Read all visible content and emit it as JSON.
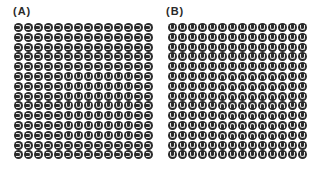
{
  "panels": [
    {
      "label": "(A)",
      "rows": 14,
      "cols": 14,
      "background_glyph": "C",
      "target_glyph": "U",
      "target_region": {
        "row_start": 5,
        "row_end": 11,
        "col_start": 5,
        "col_end": 11
      }
    },
    {
      "label": "(B)",
      "rows": 14,
      "cols": 14,
      "background_glyph": "U",
      "target_glyph": "N",
      "target_region": {
        "row_start": 5,
        "row_end": 11,
        "col_start": 5,
        "col_end": 11
      }
    }
  ],
  "glyph_legend": {
    "C": "right-facing open circle (opening on left)",
    "U": "U shape (opening on top)",
    "N": "inverted U shape (opening on bottom)"
  },
  "colors": {
    "disc": "#2b2b2b",
    "glyph": "#e8e8e8",
    "background": "#ffffff"
  }
}
